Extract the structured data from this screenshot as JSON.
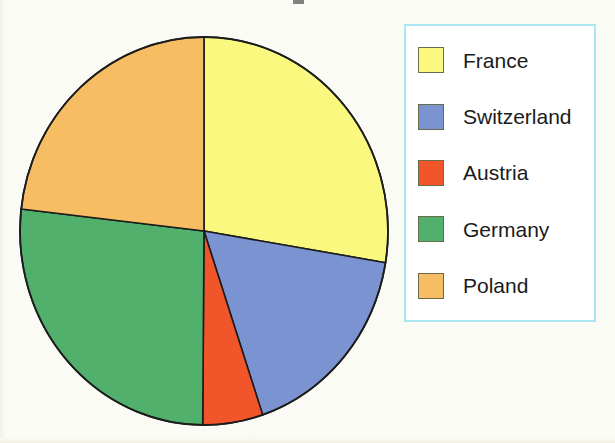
{
  "chart_data": {
    "type": "pie",
    "title": "",
    "categories": [
      "France",
      "Switzerland",
      "Austria",
      "Germany",
      "Poland"
    ],
    "values": [
      27.6,
      17.2,
      5.3,
      26.7,
      23.2
    ],
    "units": "percent",
    "start_angle_deg": 0,
    "direction": "clockwise",
    "slices": [
      {
        "label": "France",
        "value": 27.6,
        "color": "#FAF87E",
        "start_deg": 0,
        "end_deg": 99.4
      },
      {
        "label": "Switzerland",
        "value": 17.2,
        "color": "#7B93D0",
        "start_deg": 99.4,
        "end_deg": 161.4
      },
      {
        "label": "Austria",
        "value": 5.3,
        "color": "#F0562A",
        "start_deg": 161.4,
        "end_deg": 180.4
      },
      {
        "label": "Germany",
        "value": 26.7,
        "color": "#51B06C",
        "start_deg": 180.4,
        "end_deg": 276.5
      },
      {
        "label": "Poland",
        "value": 23.2,
        "color": "#F7BD63",
        "start_deg": 276.5,
        "end_deg": 360
      }
    ],
    "legend_position": "right",
    "grid": false,
    "xlabel": "",
    "ylabel": ""
  },
  "legend": {
    "border_color": "#A9E6F2",
    "background": "#FFFFFF",
    "items": [
      {
        "label": "France",
        "color": "#FAF87E"
      },
      {
        "label": "Switzerland",
        "color": "#7B93D0"
      },
      {
        "label": "Austria",
        "color": "#F0562A"
      },
      {
        "label": "Germany",
        "color": "#51B06C"
      },
      {
        "label": "Poland",
        "color": "#F7BD63"
      }
    ]
  },
  "page": {
    "background": "#FBFBF6",
    "title_fragment": ""
  },
  "pie_geometry": {
    "center_x": 204,
    "center_y": 231,
    "radius_x": 184,
    "radius_y": 194,
    "outline_color": "#1c1c1c"
  }
}
